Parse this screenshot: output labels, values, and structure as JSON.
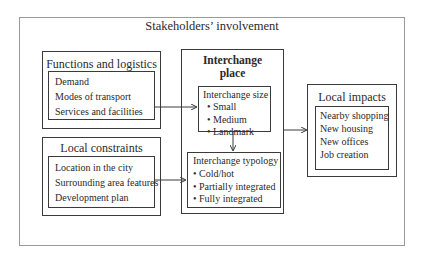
{
  "title": "Stakeholders’ involvement",
  "functions_logistics": {
    "title": "Functions and logistics",
    "items": [
      "Demand",
      "Modes of transport",
      "Services and facilities"
    ]
  },
  "local_constraints": {
    "title": "Local constraints",
    "items": [
      "Location in the city",
      "Surrounding area features",
      "Development plan"
    ]
  },
  "interchange_place": {
    "title_line1": "Interchange",
    "title_line2": "place",
    "size": {
      "title": "Interchange size",
      "items": [
        "Small",
        "Medium",
        "Landmark"
      ]
    },
    "typology": {
      "title": "Interchange typology",
      "items": [
        "Cold/hot",
        "Partially integrated",
        "Fully integrated"
      ]
    }
  },
  "local_impacts": {
    "title": "Local impacts",
    "items": [
      "Nearby shopping",
      "New housing",
      "New offices",
      "Job creation"
    ]
  },
  "bullet": "•",
  "colors": {
    "line": "#3a3a3a",
    "outer_border": "#9a9a9a"
  }
}
